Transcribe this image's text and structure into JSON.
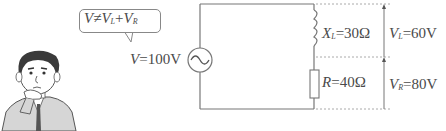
{
  "callout": {
    "lhs": "V",
    "relation": "≠",
    "term1": "V",
    "term1_sub": "L",
    "plus": "+",
    "term2": "V",
    "term2_sub": "R"
  },
  "source": {
    "symbol": "V",
    "value": "=100V",
    "icon": "ac-source-icon"
  },
  "inductor": {
    "symbol": "X",
    "sub": "L",
    "value": "=30Ω"
  },
  "resistor": {
    "symbol": "R",
    "value": "=40Ω"
  },
  "voltage_L": {
    "symbol": "V",
    "sub": "L",
    "value": "=60V"
  },
  "voltage_R": {
    "symbol": "V",
    "sub": "R",
    "value": "=80V"
  },
  "colors": {
    "line": "#777777",
    "dotted": "#aaaaaa",
    "text": "#4a4a4a"
  }
}
